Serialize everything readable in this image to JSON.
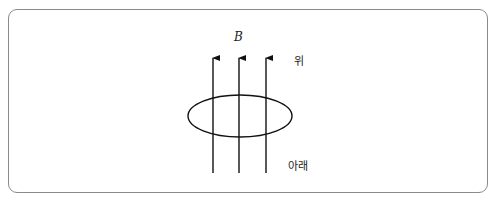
{
  "diagram": {
    "field_label": "B",
    "top_label": "위",
    "bottom_label": "아래",
    "field_lines": 3,
    "field_direction": "up",
    "loop": "ellipse"
  }
}
